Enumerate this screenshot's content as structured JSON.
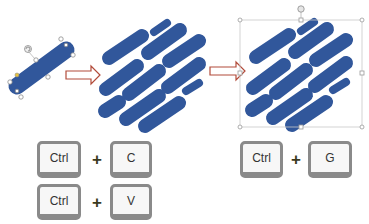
{
  "colors": {
    "pill": "#31579b",
    "arrow_stroke": "#b24b3a",
    "handle": "#8c8c8c",
    "selection_box": "#c8c8c8",
    "key_border": "#8a8a8a",
    "key_face": "#f7f7f7"
  },
  "steps": [
    {
      "name": "original-shape",
      "description": "single rounded pill selected"
    },
    {
      "name": "duplicated-shapes",
      "description": "pill copied into pattern"
    },
    {
      "name": "grouped-shapes",
      "description": "pattern grouped with selection box"
    }
  ],
  "shortcuts": {
    "copy": {
      "modifier": "Ctrl",
      "plus": "+",
      "key": "C"
    },
    "paste": {
      "modifier": "Ctrl",
      "plus": "+",
      "key": "V"
    },
    "group": {
      "modifier": "Ctrl",
      "plus": "+",
      "key": "G"
    }
  }
}
